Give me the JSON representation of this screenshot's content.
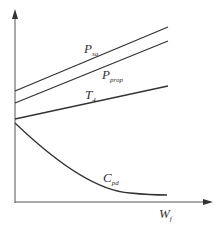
{
  "diagram": {
    "type": "qualitative-line-diagram",
    "axes": {
      "x_label": "W",
      "x_label_sub": "f",
      "y_label": ""
    },
    "curves": [
      {
        "id": "p_sq",
        "label": "P",
        "label_sub": "sq",
        "shape": "linear-increasing"
      },
      {
        "id": "p_prop",
        "label": "P",
        "label_sub": "prop",
        "shape": "linear-increasing"
      },
      {
        "id": "t4",
        "label": "T",
        "label_sub": "4",
        "shape": "linear-increasing-gentle"
      },
      {
        "id": "c_pd",
        "label": "C",
        "label_sub": "pd",
        "shape": "decreasing-convex"
      }
    ],
    "colors": {
      "line": "#333333",
      "axis": "#555555"
    }
  }
}
